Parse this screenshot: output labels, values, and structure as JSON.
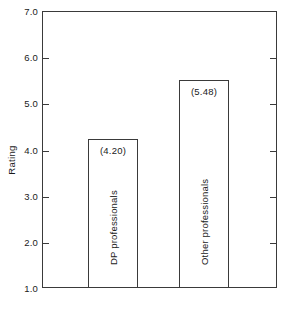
{
  "chart_data": {
    "type": "bar",
    "title": "",
    "subtitle": "",
    "xlabel": "",
    "ylabel": "Rating",
    "categories": [
      "DP professionals",
      "Other professionals"
    ],
    "values": [
      4.2,
      5.48
    ],
    "data_labels": [
      "(4.20)",
      "(5.48)"
    ],
    "ylim": [
      1.0,
      7.0
    ],
    "ytick_values": [
      7.0,
      6.0,
      5.0,
      4.0,
      3.0,
      2.0,
      1.0
    ],
    "ytick_labels": [
      "7.0",
      "6.0",
      "5.0",
      "4.0",
      "3.0",
      "2.0",
      "1.0"
    ],
    "xtick_labels": [],
    "grid": false,
    "legend": false,
    "legend_position": "none",
    "bar_fill_color": "#ffffff",
    "bar_edge_color": "#3a3a3a",
    "axis_color": "#3a3a3a",
    "background_color": "#ffffff",
    "tick_direction": "in",
    "tick_sides": [
      "left",
      "right"
    ]
  }
}
